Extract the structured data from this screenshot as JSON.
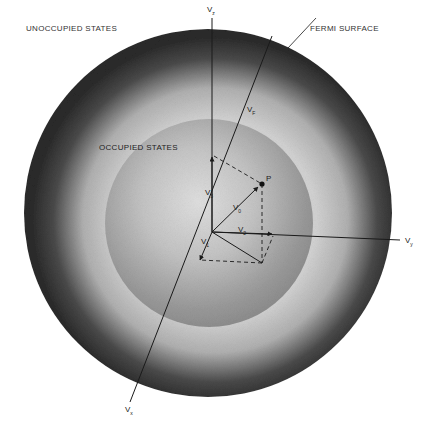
{
  "figure": {
    "type": "fermi-sphere-velocity-diagram",
    "labels": {
      "unoccupied": "UNOCCUPIED STATES",
      "fermi_surface": "FERMI SURFACE",
      "occupied": "OCCUPIED STATES",
      "point": "P"
    },
    "axes": {
      "vz": {
        "base": "V",
        "sub": "z"
      },
      "vy": {
        "base": "V",
        "sub": "y"
      },
      "vx": {
        "base": "V",
        "sub": "x"
      }
    },
    "vectors": {
      "vf": {
        "base": "V",
        "sub": "F"
      },
      "v0": {
        "base": "V",
        "sub": "0"
      },
      "v1": {
        "base": "V",
        "sub": "1"
      },
      "v2": {
        "base": "V",
        "sub": "2"
      },
      "v3": {
        "base": "V",
        "sub": "3"
      }
    },
    "colors": {
      "background": "#ffffff",
      "sphere_edge": "#1e1e1e",
      "sphere_light": "#dcdcdc",
      "inner_sphere": "#a9a9a9",
      "lines": "#1a1a1a"
    }
  }
}
